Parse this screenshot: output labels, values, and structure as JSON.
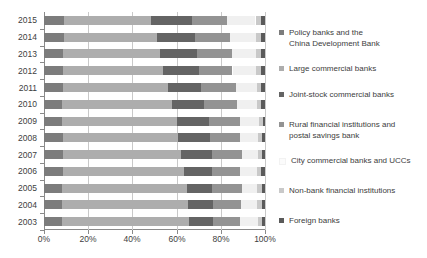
{
  "chart_data": {
    "type": "bar",
    "orientation": "horizontal",
    "stacked": true,
    "normalized": "100%",
    "title": "",
    "xlabel": "",
    "ylabel": "",
    "xlim": [
      0,
      100
    ],
    "xticks": [
      "0%",
      "20%",
      "40%",
      "60%",
      "80%",
      "100%"
    ],
    "xtick_values": [
      0,
      20,
      40,
      60,
      80,
      100
    ],
    "grid": true,
    "grid_axis": "x",
    "legend_position": "right",
    "categories": [
      "2015",
      "2014",
      "2013",
      "2012",
      "2011",
      "2010",
      "2009",
      "2008",
      "2007",
      "2006",
      "2005",
      "2004",
      "2003"
    ],
    "series": [
      {
        "name": "Policy banks and the China Development Bank",
        "color": "#7c7c7c",
        "values": [
          9.0,
          8.9,
          8.7,
          8.5,
          8.4,
          8.3,
          8.3,
          8.6,
          8.6,
          8.5,
          8.3,
          8.2,
          8.1
        ]
      },
      {
        "name": "Large commercial banks",
        "color": "#adadad",
        "values": [
          39.6,
          42.3,
          43.8,
          45.5,
          47.7,
          49.5,
          51.8,
          52.1,
          53.6,
          55.0,
          56.3,
          57.0,
          57.6
        ]
      },
      {
        "name": "Joint-stock commercial banks",
        "color": "#646464",
        "values": [
          18.5,
          17.3,
          16.9,
          16.2,
          15.0,
          14.5,
          14.6,
          14.4,
          13.9,
          12.4,
          11.6,
          11.3,
          10.7
        ]
      },
      {
        "name": "Rural financial institutions and postal savings bank",
        "color": "#939393",
        "values": [
          15.8,
          15.5,
          15.6,
          15.1,
          15.7,
          14.9,
          14.2,
          13.6,
          13.3,
          12.9,
          13.6,
          12.5,
          12.3
        ]
      },
      {
        "name": "City commercial banks and UCCs",
        "color": "#f0f0f0",
        "values": [
          12.8,
          11.9,
          11.0,
          10.7,
          9.5,
          9.1,
          8.2,
          8.2,
          7.6,
          7.8,
          6.8,
          7.5,
          8.1
        ]
      },
      {
        "name": "Non-bank financial institutions",
        "color": "#c9c9c9",
        "values": [
          2.6,
          2.4,
          2.3,
          2.3,
          2.0,
          1.9,
          1.8,
          1.9,
          1.8,
          1.8,
          2.0,
          2.1,
          1.9
        ]
      },
      {
        "name": "Foreign banks",
        "color": "#5a5a5a",
        "values": [
          1.7,
          1.7,
          1.7,
          1.7,
          1.7,
          1.8,
          1.1,
          1.2,
          1.2,
          1.6,
          1.4,
          1.4,
          1.3
        ]
      }
    ]
  },
  "legend": {
    "items": [
      {
        "label": "Policy banks and the\nChina Development Bank",
        "color": "#7c7c7c"
      },
      {
        "label": "Large commercial banks",
        "color": "#adadad"
      },
      {
        "label": "Joint-stock commercial banks",
        "color": "#646464"
      },
      {
        "label": "Rural financial institutions and\npostal savings bank",
        "color": "#939393"
      },
      {
        "label": "City commercial banks and UCCs",
        "color": "#fbfbfb"
      },
      {
        "label": "Non-bank financial institutions",
        "color": "#c9c9c9"
      },
      {
        "label": "Foreign banks",
        "color": "#5a5a5a"
      }
    ]
  }
}
